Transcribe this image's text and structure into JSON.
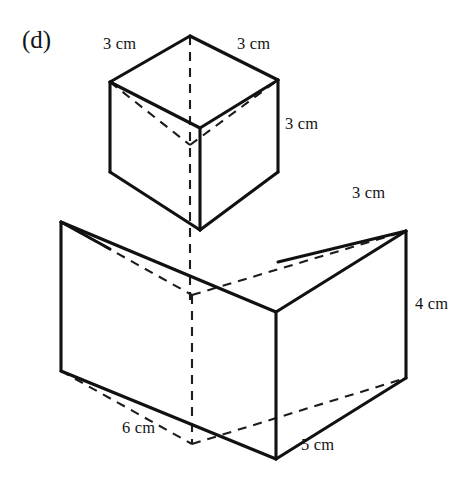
{
  "figure": {
    "part_label": "(d)",
    "line_color": "#111111",
    "hidden_line_color": "#1c1c1c",
    "background_color": "#ffffff"
  },
  "dimensions": [
    {
      "id": "cube_top_left",
      "text": "3 cm",
      "value": 3,
      "unit": "cm",
      "belongs_to": "cube",
      "edge": "top-back-left"
    },
    {
      "id": "cube_top_right",
      "text": "3 cm",
      "value": 3,
      "unit": "cm",
      "belongs_to": "cube",
      "edge": "top-back-right"
    },
    {
      "id": "cube_height",
      "text": "3 cm",
      "value": 3,
      "unit": "cm",
      "belongs_to": "cube",
      "edge": "vertical-right"
    },
    {
      "id": "box_depth",
      "text": "3 cm",
      "value": 3,
      "unit": "cm",
      "belongs_to": "cuboid",
      "edge": "top-back-right"
    },
    {
      "id": "box_height",
      "text": "4 cm",
      "value": 4,
      "unit": "cm",
      "belongs_to": "cuboid",
      "edge": "vertical-right"
    },
    {
      "id": "box_width",
      "text": "6 cm",
      "value": 6,
      "unit": "cm",
      "belongs_to": "cuboid",
      "edge": "bottom-front-left"
    },
    {
      "id": "box_side",
      "text": "5 cm",
      "value": 5,
      "unit": "cm",
      "belongs_to": "cuboid",
      "edge": "bottom-front-right"
    }
  ],
  "geometry": {
    "cube": {
      "top_apex": [
        190,
        36
      ],
      "top_left": [
        110,
        82
      ],
      "top_right": [
        278,
        80
      ],
      "top_front": [
        200,
        128
      ],
      "bottom_left": [
        110,
        172
      ],
      "bottom_right": [
        278,
        172
      ],
      "bottom_front": [
        200,
        230
      ],
      "bottom_back": [
        190,
        145
      ]
    },
    "cuboid": {
      "top_back": [
        192,
        295
      ],
      "top_left": [
        61,
        222
      ],
      "top_right": [
        406,
        231
      ],
      "top_front": [
        276,
        312
      ],
      "bottom_left": [
        61,
        371
      ],
      "bottom_right": [
        406,
        378
      ],
      "bottom_front": [
        276,
        459
      ]
    }
  }
}
